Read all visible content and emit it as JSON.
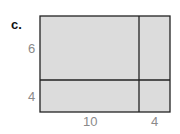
{
  "part_label": "c.",
  "area_model": {
    "fill_color": "#dcdcdc",
    "line_color": "#222222",
    "rows": [
      {
        "label": "6"
      },
      {
        "label": "4"
      }
    ],
    "columns": [
      {
        "label": "10"
      },
      {
        "label": "4"
      }
    ]
  }
}
